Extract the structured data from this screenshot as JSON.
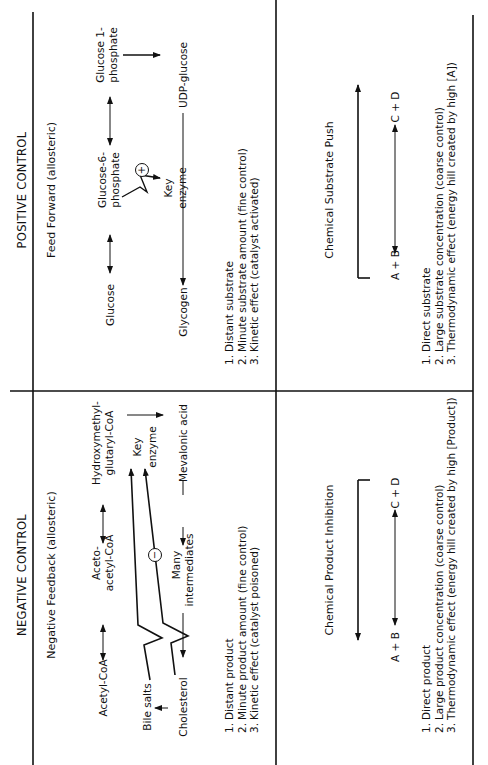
{
  "headers": {
    "negative": "NEGATIVE CONTROL",
    "positive": "POSITIVE CONTROL"
  },
  "negative_feedback": {
    "title": "Negative Feedback (allosteric)",
    "nodes": {
      "acetyl_coa": "Acetyl-CoA",
      "acetoacetyl_coa_1": "Aceto-",
      "acetoacetyl_coa_2": "acetyl-CoA",
      "hmg_coa_1": "Hydroxymethyl-",
      "hmg_coa_2": "glutaryl-CoA",
      "key": "Key",
      "enzyme": "enzyme",
      "mevalonic_acid": "Mevalonic acid",
      "many": "Many",
      "intermediates": "intermediates",
      "cholesterol": "Cholesterol",
      "bile_salts": "Bile salts",
      "inhibitor_sign": "−"
    },
    "points": [
      {
        "n": "1.",
        "text": "Distant product"
      },
      {
        "n": "2.",
        "text": "Minute product amount (fine control)"
      },
      {
        "n": "3.",
        "text": "Kinetic effect (catalyst poisoned)"
      }
    ]
  },
  "feed_forward": {
    "title": "Feed Forward (allosteric)",
    "nodes": {
      "glucose": "Glucose",
      "g6p_1": "Glucose-6-",
      "g6p_2": "phosphate",
      "g1p_1": "Glucose 1-",
      "g1p_2": "phosphate",
      "udp_glucose": "UDP-glucose",
      "glycogen": "Glycogen",
      "key": "Key",
      "enzyme": "enzyme",
      "activator_sign": "+"
    },
    "points": [
      {
        "n": "1.",
        "text": "Distant substrate"
      },
      {
        "n": "2.",
        "text": "Minute substrate amount (fine control)"
      },
      {
        "n": "3.",
        "text": "Kinetic effect (catalyst activated)"
      }
    ]
  },
  "product_inhibition": {
    "title": "Chemical Product Inhibition",
    "left": "A + B",
    "right": "C + D",
    "points": [
      {
        "n": "1.",
        "text": "Direct product"
      },
      {
        "n": "2.",
        "text": "Large product concentration (coarse control)"
      },
      {
        "n": "3.",
        "text": "Thermodynamic effect (energy hill created by high [Product])"
      }
    ]
  },
  "substrate_push": {
    "title": "Chemical Substrate Push",
    "left": "A + B",
    "right": "C + D",
    "points": [
      {
        "n": "1.",
        "text": "Direct substrate"
      },
      {
        "n": "2.",
        "text": "Large substrate concentration (coarse control)"
      },
      {
        "n": "3.",
        "text": "Thermodynamic effect (energy hill created by high [A])"
      }
    ]
  }
}
